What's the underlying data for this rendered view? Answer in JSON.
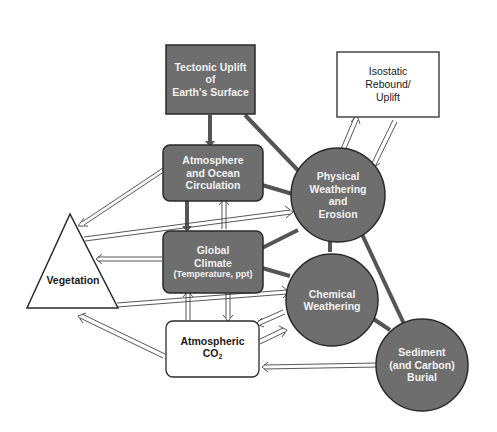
{
  "diagram": {
    "colors": {
      "filled_node": "#6e6e6e",
      "outline": "#2a2a2a",
      "light_text": "#f2f2f2",
      "dark_text": "#1a1a1a",
      "background": "#ffffff"
    },
    "nodes": {
      "tectonic": {
        "shape": "rectangle",
        "fill": "gray",
        "lines": [
          "Tectonic Uplift",
          "of",
          "Earth's Surface"
        ]
      },
      "isostatic": {
        "shape": "rectangle",
        "fill": "white",
        "lines": [
          "Isostatic",
          "Rebound/",
          "Uplift"
        ]
      },
      "atmosphere_ocean": {
        "shape": "rounded-rectangle",
        "fill": "gray",
        "lines": [
          "Atmosphere",
          "and Ocean",
          "Circulation"
        ]
      },
      "physical_weathering": {
        "shape": "circle",
        "fill": "gray",
        "lines": [
          "Physical",
          "Weathering",
          "and",
          "Erosion"
        ]
      },
      "global_climate": {
        "shape": "rounded-rectangle",
        "fill": "gray",
        "lines": [
          "Global",
          "Climate"
        ],
        "subtitle": "(Temperature, ppt)"
      },
      "vegetation": {
        "shape": "triangle",
        "fill": "white",
        "lines": [
          "Vegetation"
        ]
      },
      "chemical_weathering": {
        "shape": "circle",
        "fill": "gray",
        "lines": [
          "Chemical",
          "Weathering"
        ]
      },
      "atmospheric_co2": {
        "shape": "rounded-rectangle",
        "fill": "white",
        "lines": [
          "Atmospheric"
        ],
        "formula_main": "CO",
        "formula_sub": "2"
      },
      "sediment_burial": {
        "shape": "circle",
        "fill": "gray",
        "lines": [
          "Sediment",
          "(and Carbon)",
          "Burial"
        ]
      }
    },
    "edges": [
      {
        "from": "Tectonic Uplift of Earth's Surface",
        "to": "Atmosphere and Ocean Circulation",
        "style": "solid"
      },
      {
        "from": "Tectonic Uplift of Earth's Surface",
        "to": "Physical Weathering and Erosion",
        "style": "solid"
      },
      {
        "from": "Atmosphere and Ocean Circulation",
        "to": "Physical Weathering and Erosion",
        "style": "solid"
      },
      {
        "from": "Atmosphere and Ocean Circulation",
        "to": "Global Climate",
        "style": "solid"
      },
      {
        "from": "Global Climate",
        "to": "Atmosphere and Ocean Circulation",
        "style": "hollow"
      },
      {
        "from": "Atmosphere and Ocean Circulation",
        "to": "Vegetation",
        "style": "hollow"
      },
      {
        "from": "Vegetation",
        "to": "Physical Weathering and Erosion",
        "style": "hollow"
      },
      {
        "from": "Global Climate",
        "to": "Physical Weathering and Erosion",
        "style": "solid"
      },
      {
        "from": "Global Climate",
        "to": "Chemical Weathering",
        "style": "solid"
      },
      {
        "from": "Global Climate",
        "to": "Vegetation",
        "style": "hollow"
      },
      {
        "from": "Vegetation",
        "to": "Chemical Weathering",
        "style": "hollow"
      },
      {
        "from": "Atmospheric CO2",
        "to": "Global Climate",
        "style": "hollow"
      },
      {
        "from": "Global Climate",
        "to": "Atmospheric CO2",
        "style": "hollow"
      },
      {
        "from": "Atmospheric CO2",
        "to": "Vegetation",
        "style": "hollow"
      },
      {
        "from": "Chemical Weathering",
        "to": "Atmospheric CO2",
        "style": "hollow"
      },
      {
        "from": "Atmospheric CO2",
        "to": "Chemical Weathering",
        "style": "hollow"
      },
      {
        "from": "Sediment (and Carbon) Burial",
        "to": "Atmospheric CO2",
        "style": "hollow"
      },
      {
        "from": "Physical Weathering and Erosion",
        "to": "Chemical Weathering",
        "style": "solid"
      },
      {
        "from": "Physical Weathering and Erosion",
        "to": "Sediment (and Carbon) Burial",
        "style": "solid"
      },
      {
        "from": "Chemical Weathering",
        "to": "Sediment (and Carbon) Burial",
        "style": "solid"
      },
      {
        "from": "Physical Weathering and Erosion",
        "to": "Isostatic Rebound/Uplift",
        "style": "hollow"
      },
      {
        "from": "Isostatic Rebound/Uplift",
        "to": "Physical Weathering and Erosion",
        "style": "hollow"
      }
    ]
  }
}
